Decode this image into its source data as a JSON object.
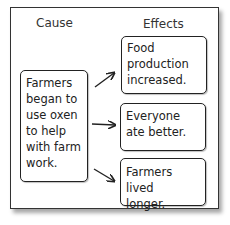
{
  "headers": {
    "cause": "Cause",
    "effects": "Effects"
  },
  "cause": {
    "text": "Farmers\nbegan to\nuse oxen\nto help\nwith farm\nwork."
  },
  "effects": [
    {
      "text": "Food\nproduction\nincreased."
    },
    {
      "text": "Everyone\nate better."
    },
    {
      "text": "Farmers lived\nlonger."
    }
  ]
}
